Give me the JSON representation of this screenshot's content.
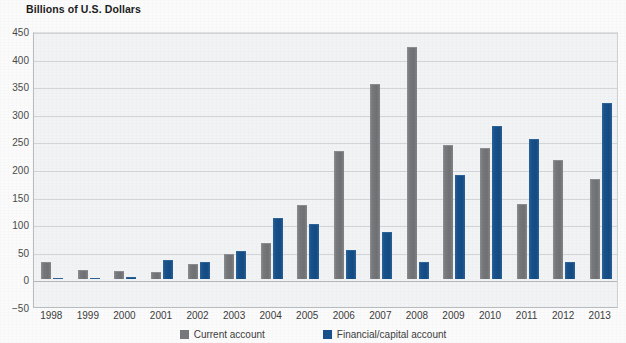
{
  "chart_data": {
    "type": "bar",
    "title": "Billions of U.S. Dollars",
    "xlabel": "",
    "ylabel": "",
    "ylim": [
      -50,
      450
    ],
    "ytick_step": 50,
    "yticks": [
      450,
      400,
      350,
      300,
      250,
      200,
      150,
      100,
      50,
      0,
      -50
    ],
    "grid": true,
    "legend_position": "bottom",
    "categories": [
      "1998",
      "1999",
      "2000",
      "2001",
      "2002",
      "2003",
      "2004",
      "2005",
      "2006",
      "2007",
      "2008",
      "2009",
      "2010",
      "2011",
      "2012",
      "2013"
    ],
    "series": [
      {
        "name": "Current account",
        "color": "#76787b",
        "values": [
          29,
          15,
          13,
          11,
          26,
          44,
          65,
          133,
          231,
          353,
          420,
          242,
          236,
          135,
          215,
          180
        ]
      },
      {
        "name": "Financial/capital account",
        "color": "#17528c",
        "values": [
          0,
          0,
          1,
          33,
          30,
          50,
          109,
          99,
          51,
          85,
          30,
          188,
          276,
          253,
          30,
          318
        ]
      }
    ]
  },
  "colors": {
    "current_account": "#76787b",
    "financial_capital_account": "#17528c",
    "plot_background": "#f2f3f4",
    "gridline": "#d2d5d7",
    "axis": "#b9bcbe"
  }
}
